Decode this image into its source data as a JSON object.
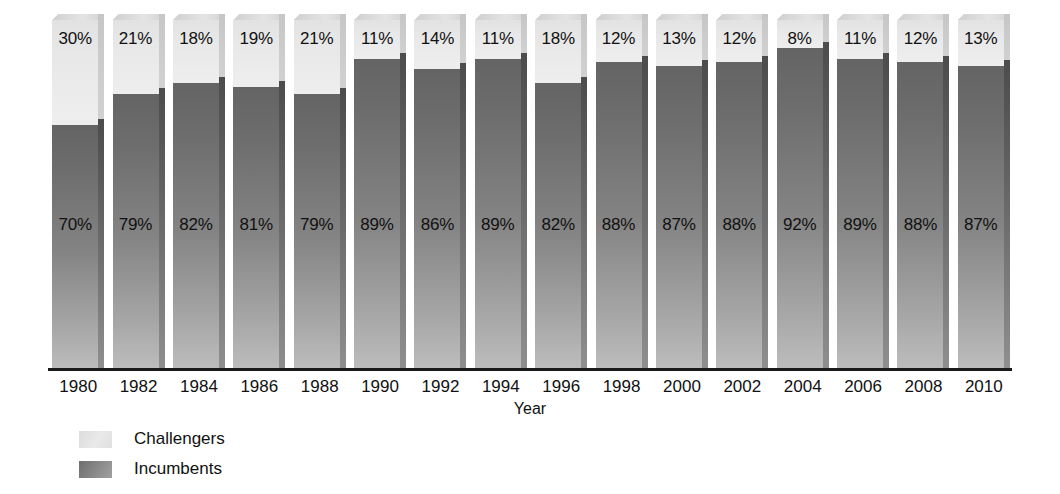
{
  "chart_data": {
    "type": "bar",
    "subtype": "stacked-percentage-column-3d",
    "title": "",
    "subtitle": "",
    "xlabel": "Year",
    "ylabel": "",
    "ylim": [
      0,
      100
    ],
    "grid": false,
    "legend_position": "bottom-left",
    "categories": [
      "1980",
      "1982",
      "1984",
      "1986",
      "1988",
      "1990",
      "1992",
      "1994",
      "1996",
      "1998",
      "2000",
      "2002",
      "2004",
      "2006",
      "2008",
      "2010"
    ],
    "series": [
      {
        "name": "Challengers",
        "color": "#e8e8e8",
        "values": [
          30,
          21,
          18,
          19,
          21,
          11,
          14,
          11,
          18,
          12,
          13,
          12,
          8,
          11,
          12,
          13
        ],
        "labels": [
          "30%",
          "21%",
          "18%",
          "19%",
          "21%",
          "11%",
          "14%",
          "11%",
          "18%",
          "12%",
          "13%",
          "12%",
          "8%",
          "11%",
          "12%",
          "13%"
        ]
      },
      {
        "name": "Incumbents",
        "color": "#848484",
        "values": [
          70,
          79,
          82,
          81,
          79,
          89,
          86,
          89,
          82,
          88,
          87,
          88,
          92,
          89,
          88,
          87
        ],
        "labels": [
          "70%",
          "79%",
          "82%",
          "81%",
          "79%",
          "89%",
          "86%",
          "89%",
          "82%",
          "88%",
          "87%",
          "88%",
          "92%",
          "89%",
          "88%",
          "87%"
        ]
      }
    ],
    "annotations": []
  },
  "axis": {
    "x_title": "Year"
  },
  "legend": {
    "items": [
      {
        "label": "Challengers",
        "swatch": "light-gray-swatch"
      },
      {
        "label": "Incumbents",
        "swatch": "dark-gray-swatch"
      }
    ]
  }
}
